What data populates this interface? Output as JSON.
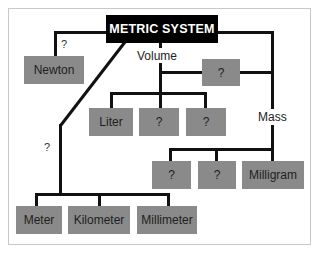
{
  "diagram": {
    "title": "METRIC SYSTEM",
    "branch_labels": {
      "newton_edge": "?",
      "length_edge": "?",
      "volume": "Volume",
      "mass": "Mass"
    },
    "nodes": {
      "newton": "Newton",
      "volume_top": "?",
      "liter": "Liter",
      "volume_q1": "?",
      "volume_q2": "?",
      "mass_q1": "?",
      "mass_q2": "?",
      "milligram": "Milligram",
      "meter": "Meter",
      "kilometer": "Kilometer",
      "millimeter": "Millimeter"
    },
    "colors": {
      "title_bg": "#000000",
      "title_text": "#ffffff",
      "node_bg": "#8a8a8a",
      "line": "#111111"
    }
  }
}
